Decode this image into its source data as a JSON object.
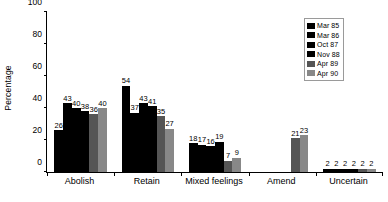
{
  "chart_data": {
    "type": "bar",
    "title": "",
    "subtitle": "",
    "xlabel": "",
    "ylabel": "Percentage",
    "ylim": [
      0,
      100
    ],
    "yticks": [
      0,
      20,
      40,
      60,
      80,
      100
    ],
    "grid": false,
    "legend_position": "top-right",
    "categories": [
      "Abolish",
      "Retain",
      "Mixed feelings",
      "Amend",
      "Uncertain"
    ],
    "series": [
      {
        "name": "Mar 85",
        "color": "#000000",
        "values": [
          26,
          54,
          18,
          null,
          2
        ]
      },
      {
        "name": "Mar 86",
        "color": "#000000",
        "values": [
          43,
          37,
          17,
          null,
          2
        ]
      },
      {
        "name": "Oct 87",
        "color": "#000000",
        "values": [
          40,
          43,
          16,
          null,
          2
        ]
      },
      {
        "name": "Nov 88",
        "color": "#000000",
        "values": [
          38,
          41,
          19,
          null,
          2
        ]
      },
      {
        "name": "Apr 89",
        "color": "#555555",
        "values": [
          36,
          35,
          7,
          21,
          2
        ]
      },
      {
        "name": "Apr 90",
        "color": "#888888",
        "values": [
          40,
          27,
          9,
          23,
          2
        ]
      }
    ]
  },
  "legend": {
    "entries": [
      {
        "month": "Mar",
        "year": "85"
      },
      {
        "month": "Mar",
        "year": "86"
      },
      {
        "month": "Oct",
        "year": "87"
      },
      {
        "month": "Nov",
        "year": "88"
      },
      {
        "month": "Apr",
        "year": "89"
      },
      {
        "month": "Apr",
        "year": "90"
      }
    ]
  }
}
